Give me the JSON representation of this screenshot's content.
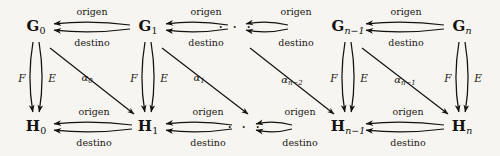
{
  "diagram": {
    "background_color": "#f6f5f1",
    "stroke_color": "#14120f",
    "ellipsis": "· · ·",
    "top_nodes": [
      {
        "id": "G0",
        "base": "G",
        "sub": "0",
        "sub_italic": false,
        "x": 36,
        "y": 27
      },
      {
        "id": "G1",
        "base": "G",
        "sub": "1",
        "sub_italic": false,
        "x": 148,
        "y": 27
      },
      {
        "id": "Gn-1",
        "base": "G",
        "sub": "n−1",
        "sub_italic": true,
        "x": 348,
        "y": 27
      },
      {
        "id": "Gn",
        "base": "G",
        "sub": "n",
        "sub_italic": true,
        "x": 462,
        "y": 27
      }
    ],
    "bottom_nodes": [
      {
        "id": "H0",
        "base": "H",
        "sub": "0",
        "sub_italic": false,
        "x": 36,
        "y": 127
      },
      {
        "id": "H1",
        "base": "H",
        "sub": "1",
        "sub_italic": false,
        "x": 148,
        "y": 127
      },
      {
        "id": "Hn-1",
        "base": "H",
        "sub": "n−1",
        "sub_italic": true,
        "x": 348,
        "y": 127
      },
      {
        "id": "Hn",
        "base": "H",
        "sub": "n",
        "sub_italic": true,
        "x": 462,
        "y": 127
      }
    ],
    "top_ellipsis": {
      "x": 236,
      "y": 27
    },
    "bottom_ellipsis": {
      "x": 245,
      "y": 127
    },
    "horizontal_pairs": [
      {
        "from": "G1",
        "to": "G0",
        "origen_x": 92,
        "origen_y": 12,
        "destino_x": 92,
        "destino_y": 43
      },
      {
        "from": "next",
        "to": "G1",
        "origen_x": 206,
        "origen_y": 12,
        "destino_x": 206,
        "destino_y": 43
      },
      {
        "from": "Gn",
        "to": "Gn-1",
        "origen_x": 406,
        "origen_y": 12,
        "destino_x": 406,
        "destino_y": 43
      },
      {
        "from": "prev",
        "to": "Gn-1",
        "origen_x": 296,
        "origen_y": 12,
        "destino_x": 296,
        "destino_y": 43
      },
      {
        "from": "H1",
        "to": "H0",
        "origen_x": 94,
        "origen_y": 112,
        "destino_x": 94,
        "destino_y": 143
      },
      {
        "from": "next",
        "to": "H1",
        "origen_x": 208,
        "origen_y": 112,
        "destino_x": 208,
        "destino_y": 143
      },
      {
        "from": "Hn",
        "to": "Hn-1",
        "origen_x": 408,
        "origen_y": 112,
        "destino_x": 408,
        "destino_y": 143
      },
      {
        "from": "prev",
        "to": "Hn-1",
        "origen_x": 300,
        "origen_y": 112,
        "destino_x": 300,
        "destino_y": 143
      }
    ],
    "labels": {
      "origen": "origen",
      "destino": "destino",
      "F": "F",
      "E": "E"
    },
    "vertical_pairs": [
      {
        "index": 0,
        "x": 36,
        "F_x": 22,
        "F_y": 78,
        "E_x": 52,
        "E_y": 78
      },
      {
        "index": 1,
        "x": 148,
        "F_x": 134,
        "F_y": 78,
        "E_x": 164,
        "E_y": 78
      },
      {
        "index": 2,
        "x": 348,
        "F_x": 334,
        "F_y": 78,
        "E_x": 364,
        "E_y": 78
      },
      {
        "index": 3,
        "x": 462,
        "F_x": 448,
        "F_y": 78,
        "E_x": 478,
        "E_y": 78
      }
    ],
    "alpha_arrows": [
      {
        "id": "a0",
        "base": "α",
        "sub": "0",
        "x1": 50,
        "y1": 48,
        "x2": 134,
        "y2": 114,
        "label_x": 87,
        "label_y": 79
      },
      {
        "id": "a1",
        "base": "α",
        "sub": "1",
        "x1": 162,
        "y1": 48,
        "x2": 248,
        "y2": 114,
        "label_x": 199,
        "label_y": 79
      },
      {
        "id": "an-2",
        "base": "α",
        "sub": "n−2",
        "x1": 250,
        "y1": 48,
        "x2": 334,
        "y2": 114,
        "label_x": 292,
        "label_y": 81
      },
      {
        "id": "an-1",
        "base": "α",
        "sub": "n−1",
        "x1": 362,
        "y1": 48,
        "x2": 448,
        "y2": 114,
        "label_x": 405,
        "label_y": 81
      }
    ]
  }
}
